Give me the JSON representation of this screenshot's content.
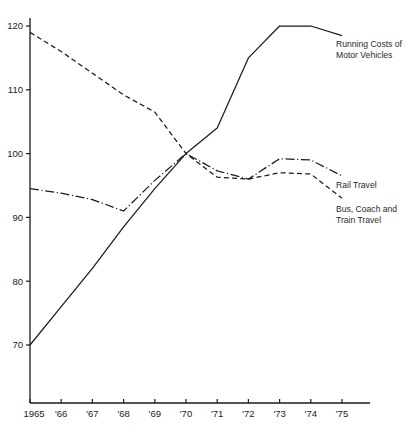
{
  "chart_data": {
    "type": "line",
    "title": "",
    "subtitle": "",
    "xlabel": "",
    "ylabel": "",
    "x": [
      1965,
      1966,
      1967,
      1968,
      1969,
      1970,
      1971,
      1972,
      1973,
      1974,
      1975
    ],
    "xtick_labels": [
      "1965",
      "'66",
      "'67",
      "'68",
      "'69",
      "'70",
      "'71",
      "'72",
      "'73",
      "'74",
      "'75"
    ],
    "ytick_labels": [
      "70",
      "80",
      "90",
      "100",
      "110",
      "120"
    ],
    "ytick_values": [
      70,
      80,
      90,
      100,
      110,
      120
    ],
    "ylim": [
      64,
      122
    ],
    "xlim": [
      1964.6,
      1975.9
    ],
    "grid": false,
    "legend_position": "inline-right-of-line-ends",
    "series": [
      {
        "name": "Running Costs of Motor Vehicles",
        "style": "solid",
        "color": "#1b1b1b",
        "values": [
          70.0,
          76.0,
          82.0,
          88.5,
          94.5,
          100.0,
          104.0,
          115.0,
          120.0,
          120.0,
          118.5
        ]
      },
      {
        "name": "Rail Travel",
        "style": "dash-dot",
        "color": "#1b1b1b",
        "values": [
          94.5,
          93.8,
          92.8,
          91.0,
          95.8,
          100.0,
          97.3,
          96.0,
          99.2,
          99.0,
          96.5
        ]
      },
      {
        "name": "Bus, Coach and Train Travel",
        "style": "dashed",
        "color": "#1b1b1b",
        "values": [
          119.0,
          116.0,
          112.6,
          109.2,
          106.5,
          100.0,
          96.3,
          96.0,
          97.0,
          96.8,
          93.0
        ]
      }
    ],
    "annotations": [
      {
        "id": "running-costs",
        "text_line1": "Running Costs of",
        "text_line2": "Motor Vehicles"
      },
      {
        "id": "rail-travel",
        "text_line1": "Rail Travel",
        "text_line2": ""
      },
      {
        "id": "bus-coach-train",
        "text_line1": "Bus, Coach and",
        "text_line2": "Train Travel"
      }
    ]
  }
}
